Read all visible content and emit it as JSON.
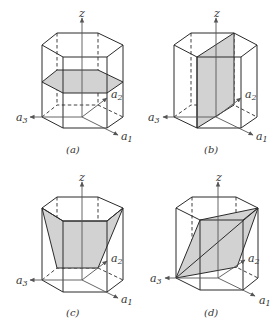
{
  "figure": {
    "panels": [
      {
        "id": "a",
        "caption": "(a)",
        "plane": "basal plane (horizontal)"
      },
      {
        "id": "b",
        "caption": "(b)",
        "plane": "prism plane (vertical)"
      },
      {
        "id": "c",
        "caption": "(c)",
        "plane": "pyramidal plane"
      },
      {
        "id": "d",
        "caption": "(d)",
        "plane": "pyramidal plane (oblique)"
      }
    ],
    "axes": {
      "z": "z",
      "a1": "a",
      "a1_sub": "1",
      "a2": "a",
      "a2_sub": "2",
      "a3": "a",
      "a3_sub": "3"
    },
    "colors": {
      "plane_fill": "#d2d2d2",
      "edge": "#2a2a2a",
      "axis": "#555555"
    }
  }
}
